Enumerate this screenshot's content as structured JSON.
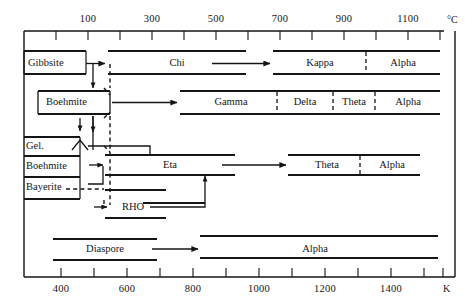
{
  "figure": {
    "kind": "thermal-transformation-sequence-chart",
    "top_axis": {
      "unit_label": "°C",
      "unit_name": "degrees-celsius",
      "tick_labels": [
        "100",
        "300",
        "500",
        "700",
        "900",
        "1100"
      ],
      "tick_values": [
        100,
        300,
        500,
        700,
        900,
        1100
      ],
      "minor_tick_count": 13,
      "range": [
        0,
        1200
      ]
    },
    "bottom_axis": {
      "unit_label": "K",
      "unit_name": "kelvin",
      "tick_labels": [
        "400",
        "600",
        "800",
        "1000",
        "1200",
        "1400"
      ],
      "tick_values": [
        400,
        600,
        800,
        1000,
        1200,
        1400
      ],
      "minor_tick_count": 13,
      "range": [
        300,
        1500
      ]
    },
    "precursors": [
      {
        "label": "Gibbsite",
        "row": 1
      },
      {
        "label": "Boehmite",
        "row": 2
      },
      {
        "label": "Gel.",
        "row": 3
      },
      {
        "label": "Boehmite",
        "row": 4
      },
      {
        "label": "Bayerite",
        "row": 5
      }
    ],
    "rows": [
      {
        "name": "gibbsite-row",
        "precursor": "Gibbsite",
        "phases": [
          "Chi",
          "Kappa",
          "Alpha"
        ]
      },
      {
        "name": "boehmite-row",
        "precursor": "Boehmite",
        "phases": [
          "Gamma",
          "Delta",
          "Theta",
          "Alpha"
        ]
      },
      {
        "name": "eta-row",
        "precursor": "Gel. / Boehmite / Bayerite",
        "phases": [
          "Eta",
          "Theta",
          "Alpha"
        ]
      },
      {
        "name": "rho-row",
        "precursor": "Bayerite",
        "phases": [
          "RHO"
        ]
      },
      {
        "name": "diaspore-row",
        "precursor": "Diaspore",
        "phases": [
          "Diaspore",
          "Alpha"
        ]
      }
    ],
    "phase_labels": {
      "chi": "Chi",
      "kappa": "Kappa",
      "alpha_1": "Alpha",
      "gamma": "Gamma",
      "delta": "Delta",
      "theta_1": "Theta",
      "alpha_2": "Alpha",
      "eta": "Eta",
      "theta_2": "Theta",
      "alpha_3": "Alpha",
      "rho": "RHO",
      "diaspore": "Diaspore",
      "alpha_4": "Alpha"
    },
    "source_labels": {
      "gibbsite": "Gibbsite",
      "boehmite_top": "Boehmite",
      "gel": "Gel.",
      "boehmite_low": "Boehmite",
      "bayerite": "Bayerite"
    },
    "colors": {
      "ink": "#151515",
      "background": "#ffffff"
    }
  }
}
